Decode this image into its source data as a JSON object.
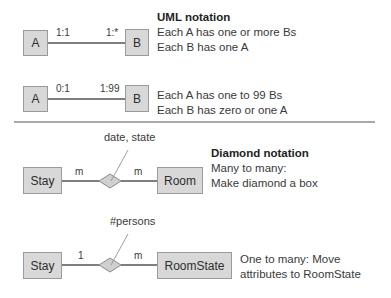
{
  "uml": {
    "example1": {
      "entity_a": "A",
      "entity_b": "B",
      "mult_a": "1:1",
      "mult_b": "1:*",
      "title": "UML notation",
      "lines": [
        "Each A has one or more Bs",
        "Each B has one A"
      ]
    },
    "example2": {
      "entity_a": "A",
      "entity_b": "B",
      "mult_a": "0:1",
      "mult_b": "1:99",
      "lines": [
        "Each A has one to 99 Bs",
        "Each B has zero or one A"
      ]
    }
  },
  "diamond": {
    "example1": {
      "entity_left": "Stay",
      "entity_right": "Room",
      "mult_left": "m",
      "mult_right": "m",
      "attributes": "date, state",
      "title": "Diamond notation",
      "lines": [
        "Many to many:",
        "Make diamond a box"
      ]
    },
    "example2": {
      "entity_left": "Stay",
      "entity_right": "RoomState",
      "mult_left": "1",
      "mult_right": "m",
      "attributes": "#persons",
      "lines": [
        "One to many: Move",
        "attributes to RoomState"
      ]
    }
  },
  "colors": {
    "box_fill": "#d8d8d8",
    "box_border": "#9a9a9a",
    "line": "#555555",
    "text": "#3a3a3a"
  }
}
